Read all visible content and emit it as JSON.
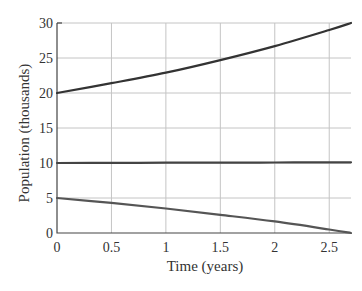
{
  "chart_data": {
    "type": "line",
    "title": "",
    "xlabel": "Time (years)",
    "ylabel": "Population (thousands)",
    "xlim": [
      0,
      2.7
    ],
    "ylim": [
      0,
      30
    ],
    "xticks": [
      0,
      0.5,
      1,
      1.5,
      2,
      2.5
    ],
    "xtick_labels": [
      "0",
      "0.5",
      "1",
      "1.5",
      "2",
      "2.5"
    ],
    "yticks": [
      0,
      5,
      10,
      15,
      20,
      25,
      30
    ],
    "ytick_labels": [
      "0",
      "5",
      "10",
      "15",
      "20",
      "25",
      "30"
    ],
    "grid": true,
    "legend": null,
    "x": [
      0,
      0.5,
      1,
      1.5,
      2,
      2.5,
      2.7
    ],
    "series": [
      {
        "name": "upper",
        "color": "#333333",
        "values": [
          20,
          21.4,
          22.9,
          24.7,
          26.7,
          29.0,
          30.0
        ]
      },
      {
        "name": "middle",
        "color": "#444444",
        "values": [
          10,
          10.02,
          10.04,
          10.06,
          10.07,
          10.09,
          10.1
        ]
      },
      {
        "name": "lower",
        "color": "#555555",
        "values": [
          5,
          4.3,
          3.5,
          2.6,
          1.65,
          0.5,
          0.0
        ]
      }
    ]
  }
}
